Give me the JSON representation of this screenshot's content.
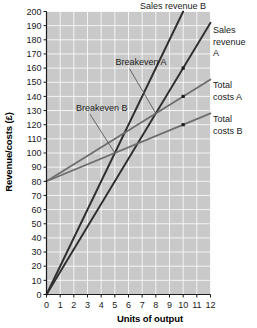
{
  "chart_data": {
    "type": "line",
    "title": "",
    "xlabel": "Units of output",
    "ylabel": "Revenue/costs (£)",
    "xlim": [
      0,
      12
    ],
    "ylim": [
      0,
      200
    ],
    "xticks": [
      "0",
      "1",
      "2",
      "3",
      "4",
      "5",
      "6",
      "7",
      "8",
      "9",
      "10",
      "11",
      "12"
    ],
    "yticks": [
      "0",
      "10",
      "20",
      "30",
      "40",
      "50",
      "60",
      "70",
      "80",
      "90",
      "100",
      "110",
      "120",
      "130",
      "140",
      "150",
      "160",
      "170",
      "180",
      "190",
      "200"
    ],
    "grid": true,
    "legend_position": "inline-labels",
    "plot_bg_color": "#c9c9c9",
    "grid_color": "#ffffff",
    "series": [
      {
        "name": "Sales revenue B",
        "label": "Sales revenue B",
        "color": "#2e2e2e",
        "width": 1.9,
        "slope": 20,
        "intercept": 0,
        "points": [
          [
            0,
            0
          ],
          [
            10,
            200
          ]
        ],
        "markers": []
      },
      {
        "name": "Sales revenue A",
        "label": "Sales revenue A",
        "color": "#2e2e2e",
        "width": 1.9,
        "slope": 16,
        "intercept": 0,
        "points": [
          [
            0,
            0
          ],
          [
            12,
            192
          ]
        ],
        "markers": [
          [
            10,
            160
          ]
        ]
      },
      {
        "name": "Total costs A",
        "label": "Total costs A",
        "color": "#6d6d6d",
        "width": 1.7,
        "slope": 6,
        "intercept": 80,
        "points": [
          [
            0,
            80
          ],
          [
            12,
            152
          ]
        ],
        "markers": [
          [
            10,
            140
          ]
        ]
      },
      {
        "name": "Total costs B",
        "label": "Total costs B",
        "color": "#6d6d6d",
        "width": 1.7,
        "slope": 4,
        "intercept": 80,
        "points": [
          [
            0,
            80
          ],
          [
            12,
            128
          ]
        ],
        "markers": [
          [
            10,
            120
          ]
        ]
      }
    ],
    "annotations": [
      {
        "name": "breakeven-a",
        "text": "Breakeven A",
        "point": [
          8,
          128
        ],
        "text_x": 5.05,
        "text_y": 162
      },
      {
        "name": "breakeven-b",
        "text": "Breakeven B",
        "point": [
          5,
          100
        ],
        "text_x": 2.15,
        "text_y": 130
      }
    ],
    "outside_labels": [
      {
        "name": "sales-revenue-b",
        "lines": [
          "Sales revenue B"
        ],
        "anchor": [
          10,
          200
        ]
      },
      {
        "name": "sales-revenue-a",
        "lines": [
          "Sales",
          "revenue",
          "A"
        ],
        "anchor": [
          12,
          192
        ]
      },
      {
        "name": "total-costs-a",
        "lines": [
          "Total",
          "costs A"
        ],
        "anchor": [
          12,
          152
        ]
      },
      {
        "name": "total-costs-b",
        "lines": [
          "Total",
          "costs B"
        ],
        "anchor": [
          12,
          128
        ]
      }
    ]
  }
}
